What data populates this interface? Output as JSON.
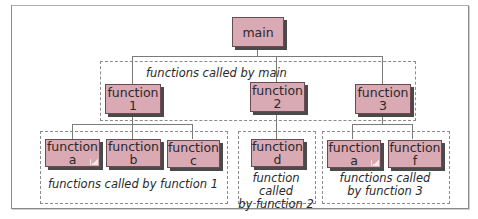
{
  "diagram": {
    "type": "function call hierarchy",
    "colors": {
      "box_fill": "#d9a9b4",
      "box_border": "#6b4a52",
      "box_shadow": "#4a4a4a",
      "connector": "#7a7a7a",
      "dashed_group": "#8a8a8a"
    },
    "root": {
      "line1": "main",
      "line2": ""
    },
    "level1": [
      {
        "line1": "function",
        "line2": "1"
      },
      {
        "line1": "function",
        "line2": "2"
      },
      {
        "line1": "function",
        "line2": "3"
      }
    ],
    "level2": [
      {
        "line1": "function",
        "line2": "a",
        "folded": true
      },
      {
        "line1": "function",
        "line2": "b"
      },
      {
        "line1": "function",
        "line2": "c"
      },
      {
        "line1": "function",
        "line2": "d"
      },
      {
        "line1": "function",
        "line2": "a",
        "folded": true
      },
      {
        "line1": "function",
        "line2": "f"
      }
    ],
    "groups": {
      "main_caption": "functions called by main",
      "f1_caption": "functions called by function 1",
      "f2_caption_line1": "function called",
      "f2_caption_line2": "by function 2",
      "f3_caption_line1": "functions called",
      "f3_caption_line2": "by function 3"
    }
  }
}
